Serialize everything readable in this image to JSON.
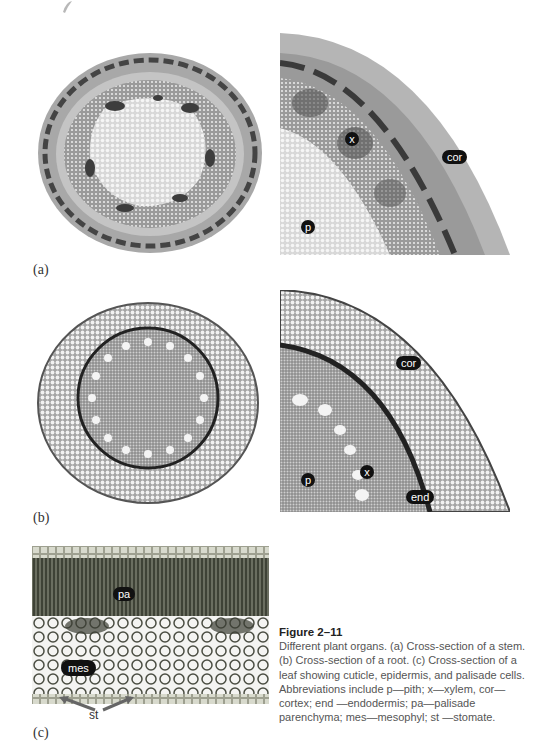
{
  "figure": {
    "number": "Figure 2–11",
    "caption": "Different plant organs. (a) Cross-section of a stem. (b) Cross-section of a root. (c) Cross-section of a leaf showing cuticle, epidermis, and palisade cells. Abbreviations include p—pith; x—xylem, cor—cortex; end —endodermis; pa—palisade parenchyma; mes—mesophyl; st —stomate."
  },
  "panels": {
    "a": {
      "label": "(a)",
      "overview_alt": "Stem cross-section, whole",
      "detail_alt": "Stem cross-section, magnified quadrant",
      "detail_tags": {
        "x": "x",
        "cor": "cor",
        "p": "p"
      }
    },
    "b": {
      "label": "(b)",
      "overview_alt": "Root cross-section, whole",
      "detail_alt": "Root cross-section, magnified quadrant",
      "detail_tags": {
        "cor": "cor",
        "x": "x",
        "p": "p",
        "end": "end"
      }
    },
    "c": {
      "label": "(c)",
      "image_alt": "Leaf cross-section",
      "tags": {
        "pa": "pa",
        "mes": "mes",
        "st": "st"
      }
    }
  },
  "colors": {
    "tissue_dark": "#3a3a3a",
    "tissue_mid": "#8a8a8a",
    "tissue_light": "#e6e6e6",
    "leaf_tint": "#7d8a6a",
    "tag_bg": "#111111",
    "arrow": "#6b6b6b"
  }
}
